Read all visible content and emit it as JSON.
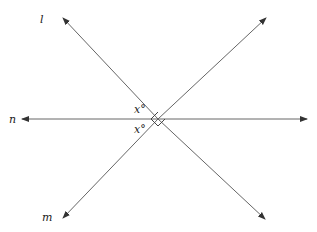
{
  "figure": {
    "lines": [
      {
        "name": "l",
        "label": "l"
      },
      {
        "name": "m",
        "label": "m"
      },
      {
        "name": "n",
        "label": "n"
      }
    ],
    "angle_labels": [
      "x°",
      "x°"
    ],
    "right_angle_marker": true,
    "line_color": "#555555"
  }
}
